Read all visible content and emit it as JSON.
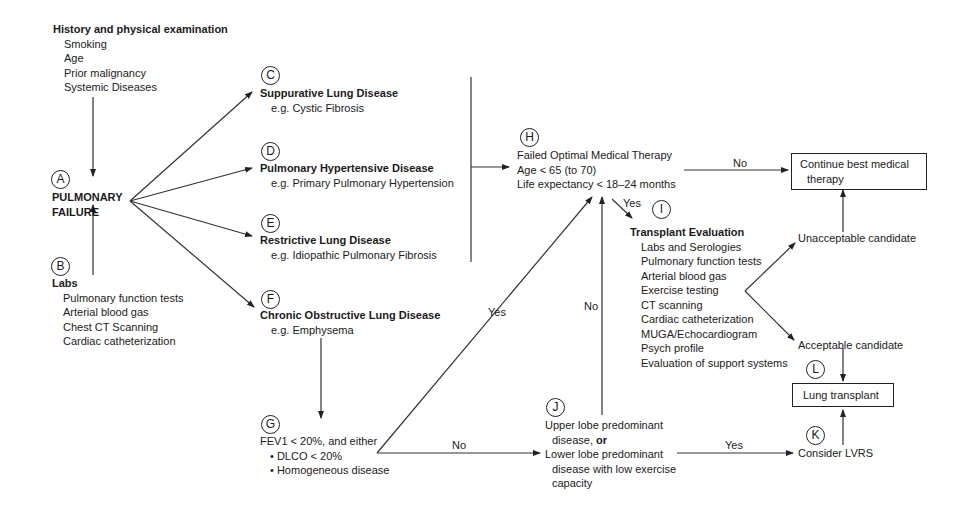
{
  "nodes": {
    "history": {
      "title": "History and physical examination",
      "items": [
        "Smoking",
        "Age",
        "Prior malignancy",
        "Systemic Diseases"
      ]
    },
    "A": {
      "label": "A",
      "title_line1": "PULMONARY",
      "title_line2": "FAILURE"
    },
    "B": {
      "label": "B",
      "title": "Labs",
      "items": [
        "Pulmonary function tests",
        "Arterial blood gas",
        "Chest CT Scanning",
        "Cardiac catheterization"
      ]
    },
    "C": {
      "label": "C",
      "title": "Suppurative Lung Disease",
      "example": "e.g. Cystic Fibrosis"
    },
    "D": {
      "label": "D",
      "title": "Pulmonary Hypertensive Disease",
      "example": "e.g. Primary Pulmonary Hypertension"
    },
    "E": {
      "label": "E",
      "title": "Restrictive Lung Disease",
      "example": "e.g. Idiopathic Pulmonary Fibrosis"
    },
    "F": {
      "label": "F",
      "title": "Chronic Obstructive Lung Disease",
      "example": "e.g. Emphysema"
    },
    "G": {
      "label": "G",
      "line1": "FEV1 < 20%, and either",
      "bullets": [
        "DLCO < 20%",
        "Homogeneous disease"
      ]
    },
    "H": {
      "label": "H",
      "lines": [
        "Failed Optimal Medical Therapy",
        "Age < 65 (to 70)",
        "Life expectancy < 18–24 months"
      ]
    },
    "I": {
      "label": "I",
      "title": "Transplant Evaluation",
      "items": [
        "Labs and Serologies",
        "Pulmonary function tests",
        "Arterial blood gas",
        "Exercise testing",
        "CT scanning",
        "Cardiac catheterization",
        "MUGA/Echocardiogram",
        "Psych profile",
        "Evaluation of support systems"
      ]
    },
    "J": {
      "label": "J",
      "line1": "Upper lobe predominant",
      "line2a": "disease, ",
      "line2b": "or",
      "line3": "Lower lobe predominant",
      "line4": "disease with low exercise",
      "line5": "capacity"
    },
    "K": {
      "label": "K",
      "text": "Consider LVRS"
    },
    "L": {
      "label": "L",
      "text": "Lung transplant"
    },
    "continue": {
      "line1": "Continue best medical",
      "line2": "therapy"
    },
    "unacceptable": {
      "text": "Unacceptable candidate"
    },
    "acceptable": {
      "text": "Acceptable candidate"
    }
  },
  "edge_labels": {
    "h_no": "No",
    "h_yes": "Yes",
    "g_yes": "Yes",
    "g_no": "No",
    "j_no": "No",
    "j_yes": "Yes"
  }
}
